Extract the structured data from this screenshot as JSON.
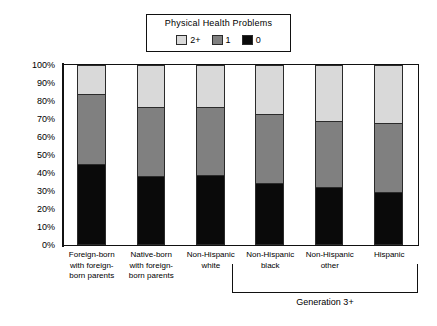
{
  "chart_data": {
    "type": "bar",
    "subtype": "stacked-bar-100-percent",
    "title": "",
    "xlabel": "",
    "ylabel": "",
    "ylim": [
      0,
      100
    ],
    "ytick_labels": [
      "100%",
      "90%",
      "80%",
      "70%",
      "60%",
      "50%",
      "40%",
      "30%",
      "20%",
      "10%",
      "0%"
    ],
    "ytick_values": [
      100,
      90,
      80,
      70,
      60,
      50,
      40,
      30,
      20,
      10,
      0
    ],
    "grid": false,
    "legend_position": "top-center",
    "legend_title": "Physical Health Problems",
    "categories": [
      "Foreign-born\nwith foreign-\nborn parents",
      "Native-born\nwith foreign-\nborn parents",
      "Non-Hispanic\nwhite",
      "Non-Hispanic\nblack",
      "Non-Hispanic\nother",
      "Hispanic"
    ],
    "series": [
      {
        "name": "0",
        "color": "#0a0a0a",
        "values": [
          45,
          38,
          39,
          34,
          32,
          29
        ]
      },
      {
        "name": "1",
        "color": "#808080",
        "values": [
          39,
          39,
          38,
          39,
          37,
          39
        ]
      },
      {
        "name": "2+",
        "color": "#d9d9d9",
        "values": [
          16,
          23,
          23,
          27,
          31,
          32
        ]
      }
    ],
    "cumulative_tops": {
      "black_top": [
        45,
        38,
        39,
        34,
        32,
        29
      ],
      "gray_top": [
        84,
        77,
        77,
        73,
        69,
        68
      ]
    },
    "annotations": [
      {
        "text": "Generation 3+",
        "covers": [
          "Non-Hispanic white",
          "Non-Hispanic black",
          "Non-Hispanic other",
          "Hispanic"
        ]
      }
    ]
  },
  "legend": {
    "title": "Physical Health Problems",
    "items": [
      {
        "label": "2+",
        "color": "#d9d9d9"
      },
      {
        "label": "1",
        "color": "#808080"
      },
      {
        "label": "0",
        "color": "#0a0a0a"
      }
    ]
  },
  "bracket": {
    "label": "Generation 3+"
  }
}
